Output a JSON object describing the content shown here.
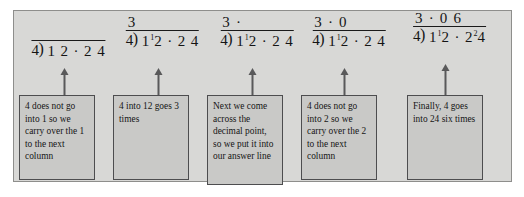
{
  "figure": {
    "frame_color": "#8e8e8c",
    "panel_color": "#d8d8d6",
    "box_color": "#c9c9c7",
    "box_border_color": "#4d4d4f",
    "arrow_color": "#59595a",
    "ink_color": "#141414"
  },
  "steps": [
    {
      "quotient": "",
      "divisor": "4",
      "bracket": ")",
      "dividend_parts": [
        {
          "text": "1",
          "carry": ""
        },
        {
          "text": "2",
          "carry": ""
        },
        {
          "text": " · ",
          "carry": ""
        },
        {
          "text": "2",
          "carry": ""
        },
        {
          "text": "4",
          "carry": ""
        }
      ],
      "dividend_plain": "1 2 · 2 4",
      "note": "4 does not go into 1 so we carry over the 1 to the next column"
    },
    {
      "quotient": "3",
      "divisor": "4",
      "bracket": ")",
      "dividend_parts": [
        {
          "text": "1",
          "carry": "1"
        },
        {
          "text": "2",
          "carry": ""
        },
        {
          "text": " · ",
          "carry": ""
        },
        {
          "text": "2",
          "carry": ""
        },
        {
          "text": "4",
          "carry": ""
        }
      ],
      "dividend_plain": "1¹2 · 2 4",
      "note": "4 into 12 goes 3 times"
    },
    {
      "quotient": "3 ·",
      "divisor": "4",
      "bracket": ")",
      "dividend_parts": [
        {
          "text": "1",
          "carry": "1"
        },
        {
          "text": "2",
          "carry": ""
        },
        {
          "text": " · ",
          "carry": ""
        },
        {
          "text": "2",
          "carry": ""
        },
        {
          "text": "4",
          "carry": ""
        }
      ],
      "dividend_plain": "1¹2 · 2 4",
      "note": "Next we come across the decimal point, so we put it into our answer line"
    },
    {
      "quotient": "3 · 0",
      "divisor": "4",
      "bracket": ")",
      "dividend_parts": [
        {
          "text": "1",
          "carry": "1"
        },
        {
          "text": "2",
          "carry": ""
        },
        {
          "text": " · ",
          "carry": ""
        },
        {
          "text": "2",
          "carry": ""
        },
        {
          "text": "4",
          "carry": ""
        }
      ],
      "dividend_plain": "1¹2 · 2 4",
      "note": "4 does not go into 2 so we carry over the 2 to the next column"
    },
    {
      "quotient": "3 · 0 6",
      "divisor": "4",
      "bracket": ")",
      "dividend_parts": [
        {
          "text": "1",
          "carry": "1"
        },
        {
          "text": "2",
          "carry": ""
        },
        {
          "text": " · ",
          "carry": ""
        },
        {
          "text": "2",
          "carry": "2"
        },
        {
          "text": "4",
          "carry": ""
        }
      ],
      "dividend_plain": "1¹2 · 2²4",
      "note": "Finally, 4 goes into 24 six times"
    }
  ]
}
